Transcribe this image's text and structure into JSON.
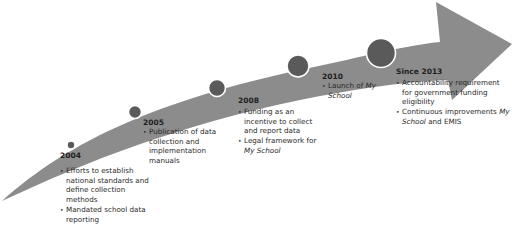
{
  "diagram": {
    "type": "timeline-arrow",
    "colors": {
      "arrow": "#8c8c8c",
      "dot_fill": "#5a5a5a",
      "dot_ring": "#ffffff",
      "text": "#222222"
    },
    "milestones": [
      {
        "year": "2004",
        "bullets": [
          {
            "text": "Efforts to establish national standards and define collection methods"
          },
          {
            "text": "Mandated school data reporting"
          }
        ]
      },
      {
        "year": "2005",
        "bullets": [
          {
            "text": "Publication of data collection and implementation manuals"
          }
        ]
      },
      {
        "year": "2008",
        "bullets": [
          {
            "text": "Funding as an incentive to collect and report data"
          },
          {
            "pre": "Legal framework for ",
            "italic": "My School",
            "post": ""
          }
        ]
      },
      {
        "year": "2010",
        "bullets": [
          {
            "pre": "Launch of ",
            "italic": "My School",
            "post": ""
          }
        ]
      },
      {
        "year": "Since 2013",
        "bullets": [
          {
            "text": "Accountability requirement for government funding eligibility"
          },
          {
            "pre": "Continuous improvements ",
            "italic": "My School",
            "post": " and EMIS"
          }
        ]
      }
    ]
  }
}
